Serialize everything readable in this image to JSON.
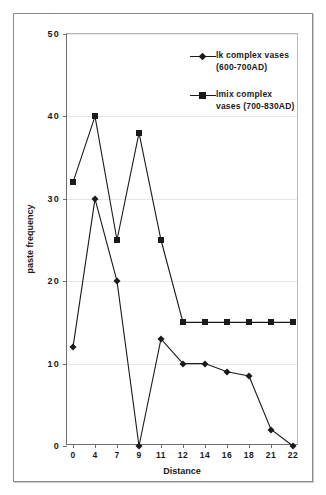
{
  "chart_data": {
    "type": "line",
    "title": "",
    "xlabel": "Distance",
    "ylabel": "paste frequency",
    "categories": [
      "0",
      "4",
      "7",
      "9",
      "11",
      "12",
      "14",
      "16",
      "18",
      "21",
      "22"
    ],
    "x_ticks": [
      "0",
      "4",
      "7",
      "9",
      "11",
      "12",
      "14",
      "16",
      "18",
      "21",
      "22"
    ],
    "y_ticks": [
      "0",
      "10",
      "20",
      "30",
      "40",
      "50"
    ],
    "ylim": [
      0,
      50
    ],
    "grid": true,
    "legend_position": "inside-top-right",
    "series": [
      {
        "name": "lk complex vases (600-700AD)",
        "marker": "diamond",
        "color": "#1a1a1a",
        "values": [
          12,
          30,
          20,
          0,
          13,
          10,
          10,
          9,
          8.5,
          2,
          0
        ]
      },
      {
        "name": "lmix complex vases (700-830AD)",
        "marker": "square",
        "color": "#1a1a1a",
        "values": [
          32,
          40,
          25,
          38,
          25,
          15,
          15,
          15,
          15,
          15,
          15
        ]
      }
    ]
  },
  "legend": {
    "entries": [
      {
        "label": "lk complex vases (600-700AD)",
        "marker": "diamond"
      },
      {
        "label": "lmix complex vases (700-830AD)",
        "marker": "square"
      }
    ]
  },
  "axes": {
    "y_title": "paste frequency",
    "x_title": "Distance"
  },
  "colors": {
    "line": "#1a1a1a",
    "grid": "#e6e6e6",
    "axis": "#6e6e6e",
    "frame": "#8a8a8a",
    "background": "#ffffff"
  }
}
